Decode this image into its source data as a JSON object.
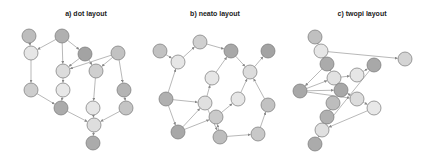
{
  "figure": {
    "panels": [
      {
        "id": "dot",
        "title": "a) dot layout",
        "title_pos": [
          86,
          16
        ],
        "nodes": [
          {
            "x": 29,
            "y": 36,
            "c": "#bdbdbd"
          },
          {
            "x": 62,
            "y": 36,
            "c": "#b0b0b0"
          },
          {
            "x": 31,
            "y": 53,
            "c": "#e6e6e6"
          },
          {
            "x": 85,
            "y": 54,
            "c": "#a3a3a3"
          },
          {
            "x": 118,
            "y": 53,
            "c": "#c2c2c2"
          },
          {
            "x": 63,
            "y": 71,
            "c": "#dcdcdc"
          },
          {
            "x": 96,
            "y": 71,
            "c": "#cfcfcf"
          },
          {
            "x": 31,
            "y": 90,
            "c": "#cdcdcd"
          },
          {
            "x": 63,
            "y": 90,
            "c": "#e8e8e8"
          },
          {
            "x": 124,
            "y": 90,
            "c": "#b4b4b4"
          },
          {
            "x": 61,
            "y": 108,
            "c": "#ababab"
          },
          {
            "x": 93,
            "y": 108,
            "c": "#e6e6e6"
          },
          {
            "x": 126,
            "y": 108,
            "c": "#c4c4c4"
          },
          {
            "x": 94,
            "y": 125,
            "c": "#dedede"
          },
          {
            "x": 93,
            "y": 143,
            "c": "#ababab"
          }
        ],
        "edges": [
          [
            0,
            2
          ],
          [
            1,
            2
          ],
          [
            1,
            5
          ],
          [
            1,
            3
          ],
          [
            3,
            5
          ],
          [
            3,
            6
          ],
          [
            4,
            5
          ],
          [
            4,
            6
          ],
          [
            4,
            9
          ],
          [
            2,
            7
          ],
          [
            5,
            8
          ],
          [
            7,
            10
          ],
          [
            8,
            10
          ],
          [
            6,
            11
          ],
          [
            9,
            12
          ],
          [
            10,
            13
          ],
          [
            11,
            13
          ],
          [
            12,
            13
          ],
          [
            13,
            14
          ]
        ]
      },
      {
        "id": "neato",
        "title": "b) neato layout",
        "title_pos": [
          215,
          16
        ],
        "nodes": [
          {
            "x": 160,
            "y": 51,
            "c": "#c2c2c2"
          },
          {
            "x": 178,
            "y": 62,
            "c": "#e6e6e6"
          },
          {
            "x": 200,
            "y": 42,
            "c": "#d0d0d0"
          },
          {
            "x": 231,
            "y": 51,
            "c": "#a8a8a8"
          },
          {
            "x": 268,
            "y": 51,
            "c": "#a3a3a3"
          },
          {
            "x": 250,
            "y": 72,
            "c": "#dcdcdc"
          },
          {
            "x": 212,
            "y": 78,
            "c": "#e6e6e6"
          },
          {
            "x": 166,
            "y": 99,
            "c": "#b0b0b0"
          },
          {
            "x": 205,
            "y": 103,
            "c": "#e0e0e0"
          },
          {
            "x": 238,
            "y": 99,
            "c": "#e6e6e6"
          },
          {
            "x": 268,
            "y": 105,
            "c": "#c2c2c2"
          },
          {
            "x": 216,
            "y": 117,
            "c": "#cacaca"
          },
          {
            "x": 178,
            "y": 132,
            "c": "#a8a8a8"
          },
          {
            "x": 220,
            "y": 137,
            "c": "#bdbdbd"
          },
          {
            "x": 258,
            "y": 134,
            "c": "#c8c8c8"
          }
        ],
        "edges": [
          [
            0,
            1
          ],
          [
            1,
            2
          ],
          [
            2,
            3
          ],
          [
            3,
            5
          ],
          [
            5,
            4
          ],
          [
            6,
            3
          ],
          [
            7,
            1
          ],
          [
            7,
            8
          ],
          [
            7,
            12
          ],
          [
            8,
            6
          ],
          [
            12,
            8
          ],
          [
            12,
            11
          ],
          [
            11,
            9
          ],
          [
            9,
            5
          ],
          [
            10,
            5
          ],
          [
            13,
            11
          ],
          [
            8,
            13
          ],
          [
            13,
            14
          ],
          [
            14,
            10
          ]
        ]
      },
      {
        "id": "twopi",
        "title": "c) twopi layout",
        "title_pos": [
          362,
          16
        ],
        "nodes": [
          {
            "x": 315,
            "y": 37,
            "c": "#c0c0c0"
          },
          {
            "x": 321,
            "y": 51,
            "c": "#e6e6e6"
          },
          {
            "x": 327,
            "y": 64,
            "c": "#ababab"
          },
          {
            "x": 334,
            "y": 78,
            "c": "#e2e2e2"
          },
          {
            "x": 300,
            "y": 91,
            "c": "#a8a8a8"
          },
          {
            "x": 341,
            "y": 90,
            "c": "#a8a8a8"
          },
          {
            "x": 357,
            "y": 75,
            "c": "#e6e6e6"
          },
          {
            "x": 374,
            "y": 65,
            "c": "#a8a8a8"
          },
          {
            "x": 405,
            "y": 59,
            "c": "#d4d4d4"
          },
          {
            "x": 357,
            "y": 99,
            "c": "#dcdcdc"
          },
          {
            "x": 374,
            "y": 108,
            "c": "#e8e8e8"
          },
          {
            "x": 333,
            "y": 103,
            "c": "#bdbdbd"
          },
          {
            "x": 327,
            "y": 117,
            "c": "#b0b0b0"
          },
          {
            "x": 322,
            "y": 130,
            "c": "#e0e0e0"
          },
          {
            "x": 315,
            "y": 144,
            "c": "#ababab"
          }
        ],
        "edges": [
          [
            0,
            1
          ],
          [
            1,
            8
          ],
          [
            1,
            2
          ],
          [
            2,
            4
          ],
          [
            4,
            3
          ],
          [
            3,
            6
          ],
          [
            6,
            7
          ],
          [
            4,
            9
          ],
          [
            5,
            9
          ],
          [
            9,
            10
          ],
          [
            10,
            13
          ],
          [
            7,
            13
          ],
          [
            12,
            13
          ],
          [
            11,
            12
          ],
          [
            13,
            14
          ],
          [
            2,
            3
          ],
          [
            4,
            5
          ]
        ]
      }
    ],
    "node_radius": 7
  }
}
